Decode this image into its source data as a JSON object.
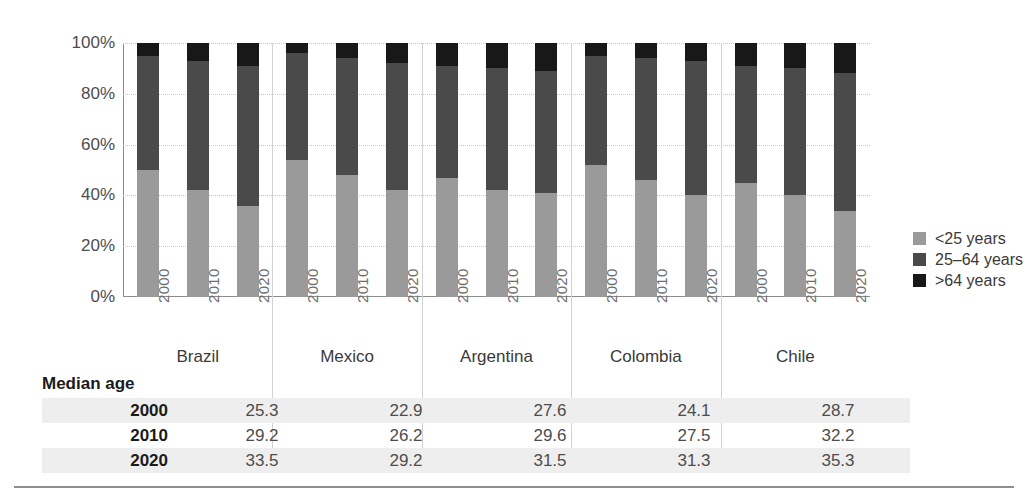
{
  "chart_data": {
    "type": "bar",
    "subtype": "stacked-percentage",
    "title": "",
    "xlabel": "",
    "ylabel": "",
    "ylim": [
      0,
      100
    ],
    "yticks": [
      "0%",
      "20%",
      "40%",
      "60%",
      "80%",
      "100%"
    ],
    "ytick_values": [
      0,
      20,
      40,
      60,
      80,
      100
    ],
    "grid": true,
    "legend_position": "right",
    "categories": [
      "Brazil",
      "Mexico",
      "Argentina",
      "Colombia",
      "Chile"
    ],
    "subcategories": [
      "2000",
      "2010",
      "2020"
    ],
    "series": [
      {
        "name": "<25 years",
        "color": "#9a9a9a",
        "values": [
          [
            50,
            42,
            36
          ],
          [
            54,
            48,
            42
          ],
          [
            47,
            42,
            41
          ],
          [
            52,
            46,
            40
          ],
          [
            45,
            40,
            34
          ]
        ]
      },
      {
        "name": "25–64 years",
        "color": "#4a4a4a",
        "values": [
          [
            45,
            51,
            55
          ],
          [
            42,
            46,
            50
          ],
          [
            44,
            48,
            48
          ],
          [
            43,
            48,
            53
          ],
          [
            46,
            50,
            54
          ]
        ]
      },
      {
        "name": ">64 years",
        "color": "#181818",
        "values": [
          [
            5,
            7,
            9
          ],
          [
            4,
            6,
            8
          ],
          [
            9,
            10,
            11
          ],
          [
            5,
            6,
            7
          ],
          [
            9,
            10,
            12
          ]
        ]
      }
    ]
  },
  "legend": {
    "items": [
      {
        "label": "<25 years",
        "color": "#9a9a9a"
      },
      {
        "label": "25–64 years",
        "color": "#4a4a4a"
      },
      {
        "label": ">64 years",
        "color": "#181818"
      }
    ]
  },
  "table": {
    "title": "Median age",
    "row_labels": [
      "2000",
      "2010",
      "2020"
    ],
    "columns": [
      "Brazil",
      "Mexico",
      "Argentina",
      "Colombia",
      "Chile"
    ],
    "rows": [
      {
        "year": "2000",
        "values": [
          "25.3",
          "22.9",
          "27.6",
          "24.1",
          "28.7"
        ]
      },
      {
        "year": "2010",
        "values": [
          "29.2",
          "26.2",
          "29.6",
          "27.5",
          "32.2"
        ]
      },
      {
        "year": "2020",
        "values": [
          "33.5",
          "29.2",
          "31.5",
          "31.3",
          "35.3"
        ]
      }
    ]
  }
}
